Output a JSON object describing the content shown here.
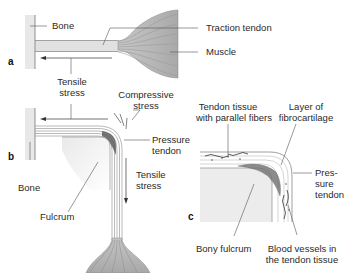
{
  "panels": {
    "a": {
      "letter": "a",
      "labels": {
        "bone": "Bone",
        "traction_tendon": "Traction tendon",
        "muscle": "Muscle",
        "tensile_1": "Tensile",
        "tensile_2": "stress"
      }
    },
    "b": {
      "letter": "b",
      "labels": {
        "compressive_1": "Compressive",
        "compressive_2": "stress",
        "pressure_1": "Pressure",
        "pressure_2": "tendon",
        "tensile_1": "Tensile",
        "tensile_2": "stress",
        "bone": "Bone",
        "fulcrum": "Fulcrum"
      }
    },
    "c": {
      "letter": "c",
      "labels": {
        "tendon_tissue_1": "Tendon tissue",
        "tendon_tissue_2": "with parallel fibers",
        "fibrocartilage_1": "Layer of",
        "fibrocartilage_2": "fibrocartilage",
        "pressure_1": "Pres-",
        "pressure_2": "sure",
        "pressure_3": "tendon",
        "bony_fulcrum": "Bony fulcrum",
        "blood_1": "Blood vessels in",
        "blood_2": "the tendon tissue"
      }
    }
  },
  "colors": {
    "muscle_fill": "#b9b9b9",
    "bone_fill": "#e6e6e6",
    "line": "#555555",
    "fibrocartilage": "#666666"
  }
}
